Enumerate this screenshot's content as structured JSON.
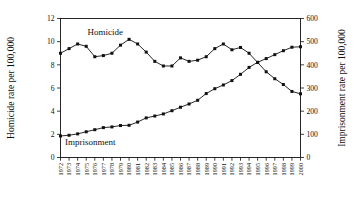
{
  "chart_data": {
    "type": "line",
    "title": "",
    "xlabel": "",
    "ylabel": "Homicide rate per 100,000",
    "y2label": "Imprisonment rate per 100,000",
    "grid": false,
    "legend_position": "inline-annotation",
    "ylim": [
      0,
      12
    ],
    "y2lim": [
      0,
      600
    ],
    "yticks": [
      "0",
      "2",
      "4",
      "6",
      "8",
      "10",
      "12"
    ],
    "y2ticks": [
      "0",
      "100",
      "200",
      "300",
      "400",
      "500",
      "600"
    ],
    "categories": [
      "1972",
      "1973",
      "1974",
      "1975",
      "1976",
      "1977",
      "1978",
      "1979",
      "1980",
      "1981",
      "1982",
      "1983",
      "1984",
      "1985",
      "1986",
      "1987",
      "1988",
      "1989",
      "1990",
      "1991",
      "1992",
      "1993",
      "1994",
      "1995",
      "1996",
      "1997",
      "1998",
      "1999",
      "2000"
    ],
    "series": [
      {
        "name": "Homicide",
        "axis": "left",
        "units": "per 100,000",
        "values": [
          9.0,
          9.4,
          9.8,
          9.6,
          8.7,
          8.8,
          9.0,
          9.7,
          10.2,
          9.8,
          9.1,
          8.3,
          7.9,
          7.9,
          8.6,
          8.3,
          8.4,
          8.7,
          9.4,
          9.8,
          9.3,
          9.5,
          9.0,
          8.2,
          7.4,
          6.8,
          6.3,
          5.7,
          5.5
        ]
      },
      {
        "name": "Imprisonment",
        "axis": "right",
        "units": "per 100,000",
        "values": [
          93,
          96,
          102,
          111,
          120,
          129,
          132,
          138,
          139,
          153,
          171,
          179,
          188,
          202,
          217,
          231,
          247,
          276,
          297,
          313,
          332,
          359,
          389,
          411,
          427,
          444,
          461,
          476,
          478
        ]
      }
    ],
    "annotations": [
      {
        "text": "Homicide",
        "near_x": "1977",
        "near_y": 10.6
      },
      {
        "text": "Imprisonment",
        "near_x": "1974",
        "near_y": 1.3
      }
    ]
  }
}
